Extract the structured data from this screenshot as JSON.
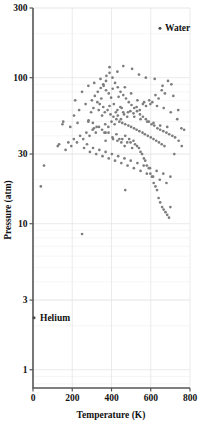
{
  "chart_data": {
    "type": "scatter",
    "title": "",
    "xlabel": "Temperature (K)",
    "ylabel": "Pressure (atm)",
    "xlim": [
      0,
      800
    ],
    "ylim": [
      0.75,
      300
    ],
    "yscale": "log",
    "xscale": "linear",
    "grid": true,
    "legend": "none",
    "xticks": [
      0,
      200,
      400,
      600,
      800
    ],
    "xticklabels": [
      "0",
      "200",
      "400",
      "600",
      "800"
    ],
    "yticks": [
      1,
      3,
      10,
      30,
      100,
      300
    ],
    "yticklabels": [
      "1",
      "3",
      "10",
      "30",
      "100",
      "300"
    ],
    "marker_color": "#7d7d7d",
    "annotations": [
      {
        "label": "Water",
        "x": 647,
        "y": 218,
        "dx": 5,
        "dy": 3
      },
      {
        "label": "Helium",
        "x": 5.2,
        "y": 2.27,
        "dx": 6,
        "dy": 3
      }
    ],
    "series": [
      {
        "name": "critical points",
        "points": [
          [
            154,
            50
          ],
          [
            126,
            34
          ],
          [
            133,
            35
          ],
          [
            150,
            48
          ],
          [
            190,
            46
          ],
          [
            209,
            55
          ],
          [
            227,
            49
          ],
          [
            283,
            51
          ],
          [
            305,
            49
          ],
          [
            282,
            50
          ],
          [
            308,
            62
          ],
          [
            310,
            45
          ],
          [
            324,
            46
          ],
          [
            364,
            42
          ],
          [
            370,
            42
          ],
          [
            385,
            42
          ],
          [
            370,
            37
          ],
          [
            405,
            39
          ],
          [
            408,
            38
          ],
          [
            430,
            37
          ],
          [
            425,
            41
          ],
          [
            440,
            38
          ],
          [
            455,
            38
          ],
          [
            450,
            36
          ],
          [
            467,
            34
          ],
          [
            470,
            40
          ],
          [
            480,
            36
          ],
          [
            490,
            38
          ],
          [
            497,
            36
          ],
          [
            505,
            33
          ],
          [
            512,
            37
          ],
          [
            520,
            35
          ],
          [
            530,
            34
          ],
          [
            540,
            33
          ],
          [
            548,
            31
          ],
          [
            556,
            30
          ],
          [
            565,
            28
          ],
          [
            572,
            27
          ],
          [
            580,
            25
          ],
          [
            590,
            24
          ],
          [
            598,
            22
          ],
          [
            606,
            21
          ],
          [
            615,
            19
          ],
          [
            624,
            18
          ],
          [
            632,
            17
          ],
          [
            640,
            15
          ],
          [
            648,
            14
          ],
          [
            658,
            13
          ],
          [
            666,
            12.5
          ],
          [
            675,
            12
          ],
          [
            684,
            11.5
          ],
          [
            693,
            11
          ],
          [
            700,
            13
          ],
          [
            430,
            60
          ],
          [
            445,
            63
          ],
          [
            460,
            58
          ],
          [
            412,
            66
          ],
          [
            398,
            73
          ],
          [
            386,
            78
          ],
          [
            372,
            82
          ],
          [
            360,
            88
          ],
          [
            348,
            72
          ],
          [
            340,
            66
          ],
          [
            335,
            60
          ],
          [
            352,
            55
          ],
          [
            366,
            58
          ],
          [
            380,
            60
          ],
          [
            395,
            56
          ],
          [
            410,
            54
          ],
          [
            425,
            52
          ],
          [
            440,
            50
          ],
          [
            455,
            49
          ],
          [
            470,
            48
          ],
          [
            486,
            47
          ],
          [
            500,
            46
          ],
          [
            515,
            45
          ],
          [
            528,
            44
          ],
          [
            542,
            43
          ],
          [
            558,
            42
          ],
          [
            570,
            41
          ],
          [
            585,
            40
          ],
          [
            600,
            39
          ],
          [
            614,
            38
          ],
          [
            628,
            37
          ],
          [
            642,
            36
          ],
          [
            656,
            35
          ],
          [
            670,
            34
          ],
          [
            300,
            70
          ],
          [
            315,
            75
          ],
          [
            330,
            80
          ],
          [
            345,
            85
          ],
          [
            358,
            90
          ],
          [
            372,
            95
          ],
          [
            390,
            108
          ],
          [
            405,
            100
          ],
          [
            418,
            92
          ],
          [
            432,
            86
          ],
          [
            446,
            80
          ],
          [
            460,
            76
          ],
          [
            474,
            72
          ],
          [
            488,
            68
          ],
          [
            502,
            65
          ],
          [
            516,
            62
          ],
          [
            530,
            59
          ],
          [
            545,
            56
          ],
          [
            560,
            54
          ],
          [
            575,
            52
          ],
          [
            590,
            50
          ],
          [
            604,
            48
          ],
          [
            618,
            47
          ],
          [
            634,
            45
          ],
          [
            648,
            44
          ],
          [
            664,
            43
          ],
          [
            680,
            42
          ],
          [
            694,
            41
          ],
          [
            710,
            40
          ],
          [
            724,
            39
          ],
          [
            740,
            60
          ],
          [
            756,
            45
          ],
          [
            705,
            90
          ],
          [
            688,
            95
          ],
          [
            672,
            78
          ],
          [
            656,
            82
          ],
          [
            640,
            72
          ],
          [
            624,
            76
          ],
          [
            608,
            68
          ],
          [
            592,
            70
          ],
          [
            576,
            64
          ],
          [
            560,
            66
          ],
          [
            544,
            60
          ],
          [
            528,
            63
          ],
          [
            512,
            57
          ],
          [
            496,
            59
          ],
          [
            480,
            54
          ],
          [
            464,
            56
          ],
          [
            448,
            52
          ],
          [
            432,
            55
          ],
          [
            416,
            48
          ],
          [
            400,
            50
          ],
          [
            384,
            46
          ],
          [
            368,
            48
          ],
          [
            352,
            44
          ],
          [
            336,
            46
          ],
          [
            320,
            42
          ],
          [
            304,
            44
          ],
          [
            288,
            40
          ],
          [
            272,
            42
          ],
          [
            256,
            38
          ],
          [
            240,
            40
          ],
          [
            224,
            36
          ],
          [
            208,
            38
          ],
          [
            195,
            34
          ],
          [
            180,
            36
          ],
          [
            166,
            32
          ],
          [
            260,
            33
          ],
          [
            275,
            35
          ],
          [
            290,
            31
          ],
          [
            306,
            33
          ],
          [
            322,
            30
          ],
          [
            338,
            32
          ],
          [
            354,
            29
          ],
          [
            370,
            31
          ],
          [
            386,
            28
          ],
          [
            402,
            30
          ],
          [
            418,
            27
          ],
          [
            434,
            29
          ],
          [
            450,
            26
          ],
          [
            466,
            28
          ],
          [
            482,
            25
          ],
          [
            498,
            27
          ],
          [
            514,
            24
          ],
          [
            532,
            26
          ],
          [
            548,
            23
          ],
          [
            564,
            25
          ],
          [
            580,
            22
          ],
          [
            596,
            24
          ],
          [
            612,
            21
          ],
          [
            630,
            23
          ],
          [
            646,
            20
          ],
          [
            664,
            22
          ],
          [
            680,
            19
          ],
          [
            700,
            21
          ],
          [
            720,
            30
          ],
          [
            742,
            37
          ],
          [
            758,
            34
          ],
          [
            770,
            44
          ],
          [
            460,
            120
          ],
          [
            505,
            115
          ],
          [
            430,
            110
          ],
          [
            390,
            118
          ],
          [
            540,
            105
          ],
          [
            575,
            100
          ],
          [
            620,
            98
          ],
          [
            660,
            88
          ],
          [
            715,
            75
          ],
          [
            735,
            52
          ],
          [
            56,
            25
          ],
          [
            250,
            8.5
          ],
          [
            470,
            17
          ],
          [
            40,
            18
          ],
          [
            215,
            70
          ],
          [
            235,
            60
          ],
          [
            250,
            80
          ],
          [
            268,
            66
          ],
          [
            282,
            88
          ],
          [
            296,
            58
          ],
          [
            312,
            92
          ],
          [
            328,
            68
          ],
          [
            344,
            98
          ],
          [
            358,
            63
          ],
          [
            374,
            103
          ],
          [
            390,
            64
          ],
          [
            406,
            84
          ],
          [
            422,
            58
          ],
          [
            436,
            74
          ],
          [
            452,
            62
          ],
          [
            468,
            86
          ],
          [
            484,
            58
          ],
          [
            500,
            78
          ],
          [
            516,
            54
          ],
          [
            532,
            70
          ],
          [
            548,
            52
          ],
          [
            566,
            68
          ],
          [
            582,
            50
          ],
          [
            598,
            66
          ],
          [
            614,
            49
          ],
          [
            632,
            64
          ],
          [
            648,
            47
          ],
          [
            666,
            62
          ],
          [
            684,
            46
          ],
          [
            702,
            58
          ]
        ]
      }
    ]
  }
}
